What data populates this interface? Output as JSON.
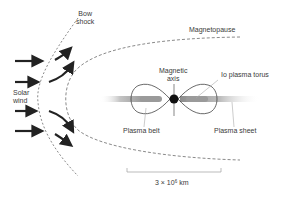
{
  "diagram": {
    "labels": {
      "bow_shock_line1": "Bow",
      "bow_shock_line2": "shock",
      "magnetopause": "Magnetopause",
      "magnetic_axis_line1": "Magnetic",
      "magnetic_axis_line2": "axis",
      "io_plasma_torus": "Io plasma torus",
      "solar_wind_line1": "Solar",
      "solar_wind_line2": "wind",
      "plasma_belt": "Plasma belt",
      "plasma_sheet": "Plasma sheet",
      "scale_prefix": "3 × 10",
      "scale_exponent": "6",
      "scale_unit": " km"
    },
    "colors": {
      "ink": "#222222",
      "dashed": "#8a8a8a",
      "sheet_dark": "#9a9a9a",
      "planet": "#111111"
    }
  }
}
